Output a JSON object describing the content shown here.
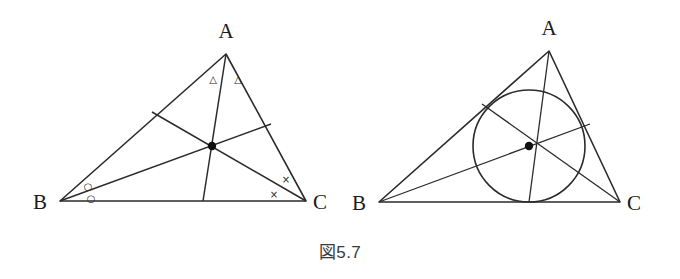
{
  "figure": {
    "caption_symbol": "図",
    "caption_number": "5.7",
    "caption_full": "図 5.7",
    "stroke_color": "#2b2b2b",
    "background_color": "#ffffff"
  },
  "panels": [
    {
      "id": "left-panel",
      "name": "triangle-with-angle-bisectors",
      "labels": {
        "a": "A",
        "b": "B",
        "c": "C"
      },
      "vertices": {
        "A": {
          "x": 226,
          "y": 54
        },
        "B": {
          "x": 60,
          "y": 201
        },
        "C": {
          "x": 306,
          "y": 201
        }
      },
      "label_positions": {
        "A": {
          "x": 226,
          "y": 38
        },
        "B": {
          "x": 40,
          "y": 208
        },
        "C": {
          "x": 320,
          "y": 208
        }
      },
      "incenter": {
        "x": 212,
        "y": 146
      },
      "cevian_feet": {
        "from_A_on_BC": {
          "x": 203,
          "y": 201
        },
        "from_B_on_AC": {
          "x": 271,
          "y": 124
        },
        "from_C_on_AB": {
          "x": 152,
          "y": 112
        }
      },
      "angle_marks": [
        {
          "symbol": "△",
          "name": "angle-mark-a1",
          "x": 213,
          "y": 80
        },
        {
          "symbol": "△",
          "name": "angle-mark-a2",
          "x": 237,
          "y": 80
        },
        {
          "symbol": "○",
          "name": "angle-mark-b1",
          "x": 88,
          "y": 186
        },
        {
          "symbol": "○",
          "name": "angle-mark-b2",
          "x": 91,
          "y": 198
        },
        {
          "symbol": "×",
          "name": "angle-mark-c1",
          "x": 286,
          "y": 179
        },
        {
          "symbol": "×",
          "name": "angle-mark-c2",
          "x": 274,
          "y": 194
        }
      ]
    },
    {
      "id": "right-panel",
      "name": "triangle-with-incircle",
      "labels": {
        "a": "A",
        "b": "B",
        "c": "C"
      },
      "vertices": {
        "A": {
          "x": 549,
          "y": 51
        },
        "B": {
          "x": 379,
          "y": 202
        },
        "C": {
          "x": 620,
          "y": 202
        }
      },
      "label_positions": {
        "A": {
          "x": 549,
          "y": 35
        },
        "B": {
          "x": 359,
          "y": 209
        },
        "C": {
          "x": 634,
          "y": 209
        }
      },
      "incenter": {
        "x": 529,
        "y": 146
      },
      "incircle": {
        "cx": 529,
        "cy": 146,
        "r": 56
      },
      "cevian_feet": {
        "from_A_on_BC": {
          "x": 529,
          "y": 202
        },
        "from_B_on_AC": {
          "x": 590,
          "y": 124
        },
        "from_C_on_AB": {
          "x": 482,
          "y": 104
        }
      }
    }
  ]
}
